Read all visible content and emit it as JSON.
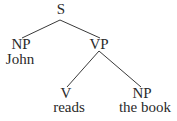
{
  "diagram": {
    "type": "syntax-tree",
    "nodes": {
      "s": {
        "label": "S",
        "word": null
      },
      "np1": {
        "label": "NP",
        "word": "John"
      },
      "vp": {
        "label": "VP",
        "word": null
      },
      "v": {
        "label": "V",
        "word": "reads"
      },
      "np2": {
        "label": "NP",
        "word": "the book"
      }
    },
    "edges": [
      {
        "from": "S",
        "to": "NP (John)"
      },
      {
        "from": "S",
        "to": "VP"
      },
      {
        "from": "VP",
        "to": "V (reads)"
      },
      {
        "from": "VP",
        "to": "NP (the book)"
      }
    ]
  }
}
